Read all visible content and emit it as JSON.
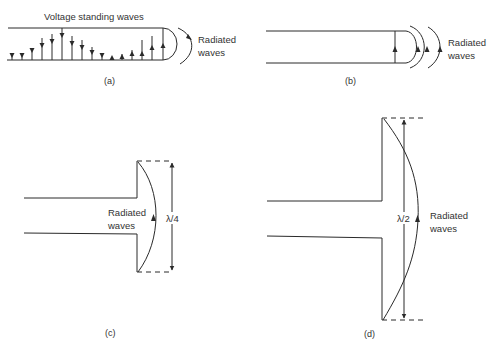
{
  "figure": {
    "panels": [
      {
        "id": "a",
        "caption": "(a)",
        "title_label": "Voltage standing waves",
        "radiated_label_line1": "Radiated",
        "radiated_label_line2": "waves",
        "description": "Open-ended two-wire transmission line with voltage standing wave arrows between conductors, ending in a semicircular loop that radiates"
      },
      {
        "id": "b",
        "caption": "(b)",
        "radiated_label_line1": "Radiated",
        "radiated_label_line2": "waves",
        "description": "Line end with a single field arrow and three curved radiated wavefronts"
      },
      {
        "id": "c",
        "caption": "(c)",
        "radiated_label_line1": "Radiated",
        "radiated_label_line2": "waves",
        "dimension_label": "λ/4",
        "description": "Line flared into a quarter-wavelength flange with a curved radiating field"
      },
      {
        "id": "d",
        "caption": "(d)",
        "radiated_label_line1": "Radiated",
        "radiated_label_line2": "waves",
        "dimension_label": "λ/2",
        "description": "Line flared into a half-wavelength flange with a curved radiating field"
      }
    ]
  },
  "colors": {
    "line": "#2a2a2a",
    "text": "#333333",
    "background": "#ffffff"
  }
}
